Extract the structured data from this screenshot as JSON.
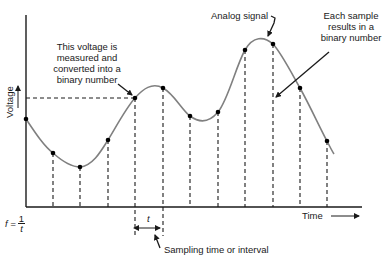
{
  "diagram": {
    "title": "",
    "axes": {
      "y_label": "Voltage",
      "x_label": "Time"
    },
    "annotations": {
      "analog_signal": "Analog signal",
      "each_sample": [
        "Each sample",
        "results in a",
        "binary number"
      ],
      "this_voltage": [
        "This voltage is",
        "measured and",
        "converted into a",
        "binary number"
      ],
      "sampling_interval": "Sampling time or interval",
      "interval_symbol": "t",
      "frequency_formula": {
        "lhs": "f =",
        "numerator": "1",
        "denominator": "t"
      }
    },
    "colors": {
      "signal": "#808080",
      "axes": "#1a1a1a",
      "dashed": "#1a1a1a",
      "points": "#000000"
    },
    "sample_points": [
      {
        "x": 26,
        "y": 119
      },
      {
        "x": 53,
        "y": 153
      },
      {
        "x": 80,
        "y": 167
      },
      {
        "x": 108,
        "y": 140
      },
      {
        "x": 135,
        "y": 98
      },
      {
        "x": 163,
        "y": 88
      },
      {
        "x": 190,
        "y": 116
      },
      {
        "x": 218,
        "y": 112
      },
      {
        "x": 245,
        "y": 50
      },
      {
        "x": 273,
        "y": 44
      },
      {
        "x": 300,
        "y": 88
      },
      {
        "x": 327,
        "y": 141
      }
    ]
  }
}
